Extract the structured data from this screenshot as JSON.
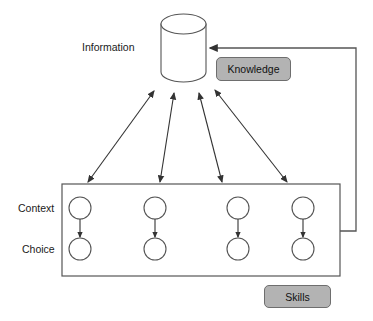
{
  "diagram": {
    "labels": {
      "information": "Information",
      "context": "Context",
      "choice": "Choice"
    },
    "boxes": [
      {
        "id": "knowledge",
        "label": "Knowledge",
        "fill": "#b3b3b3",
        "stroke": "#6e6e6e"
      },
      {
        "id": "skills",
        "label": "Skills",
        "fill": "#b3b3b3",
        "stroke": "#6e6e6e"
      }
    ],
    "nodes": {
      "cylinder": {
        "name": "Information",
        "x": 161,
        "y": 14,
        "width": 45,
        "height": 69
      },
      "context_choice_panel": {
        "x": 62,
        "y": 184,
        "width": 278,
        "height": 92
      },
      "columns": [
        80,
        155,
        238,
        303
      ],
      "context_row_y": 208,
      "choice_row_y": 249,
      "circle_radius": 11
    },
    "edges": [
      {
        "from": "context-circle-1",
        "to": "information",
        "type": "double-arrow"
      },
      {
        "from": "context-circle-2",
        "to": "information",
        "type": "double-arrow"
      },
      {
        "from": "context-circle-3",
        "to": "information",
        "type": "double-arrow"
      },
      {
        "from": "context-circle-4",
        "to": "information",
        "type": "double-arrow"
      },
      {
        "from": "context-circle-1",
        "to": "choice-circle-1",
        "type": "arrow"
      },
      {
        "from": "context-circle-2",
        "to": "choice-circle-2",
        "type": "arrow"
      },
      {
        "from": "context-circle-3",
        "to": "choice-circle-3",
        "type": "arrow"
      },
      {
        "from": "context-circle-4",
        "to": "choice-circle-4",
        "type": "arrow"
      },
      {
        "from": "context-choice-panel",
        "to": "information",
        "type": "feedback-arrow"
      }
    ],
    "colors": {
      "stroke": "#444444",
      "box_fill": "#b3b3b3",
      "box_stroke": "#6e6e6e",
      "background": "#ffffff",
      "text": "#1a1a1a"
    }
  }
}
